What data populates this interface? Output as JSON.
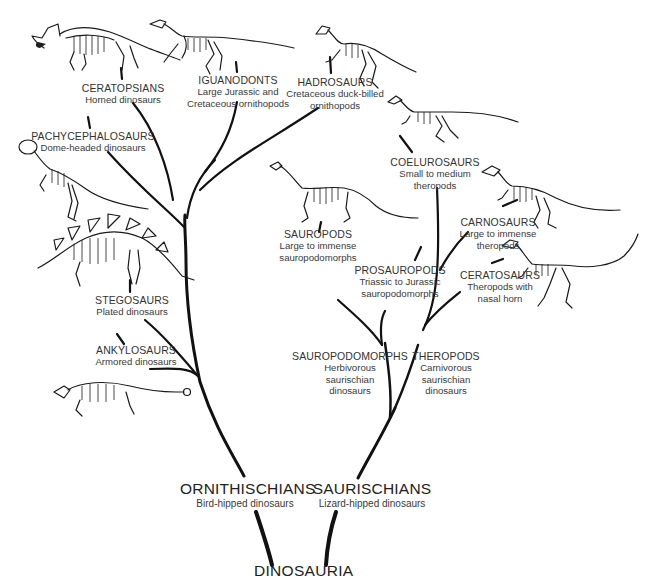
{
  "diagram": {
    "type": "phylogenetic-tree",
    "root": {
      "label": "DINOSAURIA"
    },
    "clades": [
      {
        "name": "ORNITHISCHIANS",
        "description": "Bird-hipped dinosaurs",
        "children": [
          {
            "name": "ANKYLOSAURS",
            "description": "Armored dinosaurs",
            "icon": "ankylosaur-skeleton-icon"
          },
          {
            "name": "STEGOSAURS",
            "description": "Plated dinosaurs",
            "icon": "stegosaur-skeleton-icon"
          },
          {
            "name": "PACHYCEPHALOSAURS",
            "description": "Dome-headed dinosaurs",
            "icon": "pachycephalosaur-skeleton-icon"
          },
          {
            "name": "CERATOPSIANS",
            "description": "Horned dinosaurs",
            "icon": "ceratopsian-skeleton-icon"
          },
          {
            "name": "IGUANODONTS",
            "description": "Large Jurassic and Cretaceous ornithopods",
            "icon": "iguanodont-skeleton-icon"
          },
          {
            "name": "HADROSAURS",
            "description": "Cretaceous duck-billed ornithopods",
            "icon": "hadrosaur-skeleton-icon"
          }
        ]
      },
      {
        "name": "SAURISCHIANS",
        "description": "Lizard-hipped dinosaurs",
        "children": [
          {
            "name": "SAUROPODOMORPHS",
            "description": "Herbivorous saurischian dinosaurs",
            "children": [
              {
                "name": "PROSAUROPODS",
                "description": "Triassic to Jurassic sauropodomorphs"
              },
              {
                "name": "SAUROPODS",
                "description": "Large to immense sauropodomorphs",
                "icon": "sauropod-skeleton-icon"
              }
            ]
          },
          {
            "name": "THEROPODS",
            "description": "Carnivorous saurischian dinosaurs",
            "children": [
              {
                "name": "CERATOSAURS",
                "description": "Theropods with nasal horn",
                "icon": "ceratosaur-skeleton-icon"
              },
              {
                "name": "CARNOSAURS",
                "description": "Large to immense theropods",
                "icon": "carnosaur-skeleton-icon"
              },
              {
                "name": "COELUROSAURS",
                "description": "Small to medium theropods",
                "icon": "coelurosaur-skeleton-icon"
              }
            ]
          }
        ]
      }
    ]
  },
  "labels": {
    "root": "DINOSAURIA",
    "ornithischians": {
      "name": "ORNITHISCHIANS",
      "desc": "Bird-hipped dinosaurs"
    },
    "saurischians": {
      "name": "SAURISCHIANS",
      "desc": "Lizard-hipped dinosaurs"
    },
    "ceratopsians": {
      "name": "CERATOPSIANS",
      "desc": "Horned dinosaurs"
    },
    "iguanodonts": {
      "name": "IGUANODONTS",
      "desc1": "Large Jurassic and",
      "desc2": "Cretaceous ornithopods"
    },
    "hadrosaurs": {
      "name": "HADROSAURS",
      "desc1": "Cretaceous duck-billed",
      "desc2": "ornithopods"
    },
    "pachycephalosaurs": {
      "name": "PACHYCEPHALOSAURS",
      "desc": "Dome-headed dinosaurs"
    },
    "stegosaurs": {
      "name": "STEGOSAURS",
      "desc": "Plated dinosaurs"
    },
    "ankylosaurs": {
      "name": "ANKYLOSAURS",
      "desc": "Armored dinosaurs"
    },
    "coelurosaurs": {
      "name": "COELUROSAURS",
      "desc1": "Small to medium",
      "desc2": "theropods"
    },
    "carnosaurs": {
      "name": "CARNOSAURS",
      "desc1": "Large to immense",
      "desc2": "theropods"
    },
    "ceratosaurs": {
      "name": "CERATOSAURS",
      "desc1": "Theropods with",
      "desc2": "nasal horn"
    },
    "sauropods": {
      "name": "SAUROPODS",
      "desc1": "Large to immense",
      "desc2": "sauropodomorphs"
    },
    "prosauropods": {
      "name": "PROSAUROPODS",
      "desc1": "Triassic to Jurassic",
      "desc2": "sauropodomorphs"
    },
    "sauropodomorphs": {
      "name": "SAUROPODOMORPHS",
      "desc1": "Herbivorous",
      "desc2": "saurischian",
      "desc3": "dinosaurs"
    },
    "theropods": {
      "name": "THEROPODS",
      "desc1": "Carnivorous",
      "desc2": "saurischian",
      "desc3": "dinosaurs"
    }
  },
  "colors": {
    "background": "#ffffff",
    "branch": "#111111",
    "text": "#2a2a2a"
  }
}
